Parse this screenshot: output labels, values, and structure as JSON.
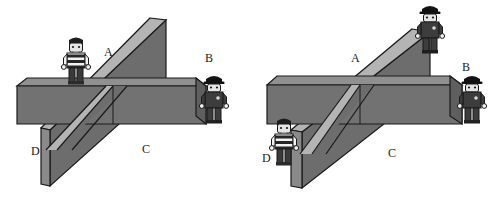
{
  "image": {
    "width": 499,
    "height": 201,
    "background": "#ffffff",
    "description": "Two side-by-side line drawings of a horizontal rectangular beam crossed by an inclined plank (ramp), with two toy minifigures placed at lettered positions."
  },
  "colors": {
    "beam_top_face": "#8f8f8f",
    "beam_front_face": "#707070",
    "ramp_face": "#6d6d6d",
    "ramp_edge": "#a9a9a9",
    "outline": "#1a1a1a",
    "label_text": "#1a1a1a",
    "prisoner_shirt_stripe_dark": "#2b2b2b",
    "prisoner_shirt_stripe_light": "#f2f2f2",
    "prisoner_skin": "#e8e8e8",
    "prisoner_hair": "#1e1e1e",
    "prisoner_legs": "#3a3a3a",
    "officer_uniform": "#3d3d3d",
    "officer_cap": "#141414",
    "officer_face": "#e8e8e8"
  },
  "panels": [
    {
      "id": "left-panel",
      "name": "left-diagram",
      "labels": [
        {
          "id": "left-label-a",
          "text": "A",
          "x": 104,
          "y": 46
        },
        {
          "id": "left-label-b",
          "text": "B",
          "x": 205,
          "y": 52
        },
        {
          "id": "left-label-c",
          "text": "C",
          "x": 142,
          "y": 143
        },
        {
          "id": "left-label-d",
          "text": "D",
          "x": 31,
          "y": 145
        }
      ],
      "figures": [
        {
          "id": "left-prisoner",
          "type": "prisoner",
          "name": "striped-shirt-figure",
          "standing_on": "beam top, left of crossing",
          "x": 60,
          "y": 36,
          "scale": 1.0
        },
        {
          "id": "left-officer",
          "type": "officer",
          "name": "police-officer-figure",
          "standing_on": "ground, right of beam",
          "x": 198,
          "y": 74,
          "scale": 1.0
        }
      ],
      "ramp": {
        "orientation": "steep",
        "direction": "lower-left to upper-right",
        "top_end_x": 164,
        "top_end_y": 18,
        "bottom_end_x": 50,
        "bottom_end_y": 186
      }
    },
    {
      "id": "right-panel",
      "name": "right-diagram",
      "labels": [
        {
          "id": "right-label-a",
          "text": "A",
          "x": 351,
          "y": 52
        },
        {
          "id": "right-label-b",
          "text": "B",
          "x": 462,
          "y": 61
        },
        {
          "id": "right-label-c",
          "text": "C",
          "x": 388,
          "y": 147
        },
        {
          "id": "right-label-d",
          "text": "D",
          "x": 262,
          "y": 152
        }
      ],
      "figures": [
        {
          "id": "right-officer-top",
          "type": "officer",
          "name": "police-officer-figure",
          "standing_on": "top of the inclined ramp",
          "x": 414,
          "y": 4,
          "scale": 1.0
        },
        {
          "id": "right-officer-side",
          "type": "officer",
          "name": "police-officer-figure",
          "standing_on": "ground, right of beam",
          "x": 456,
          "y": 74,
          "scale": 1.0
        },
        {
          "id": "right-prisoner",
          "type": "prisoner",
          "name": "striped-shirt-figure",
          "standing_on": "ground, left of beam",
          "x": 268,
          "y": 117,
          "scale": 1.0
        }
      ],
      "ramp": {
        "orientation": "shallow",
        "direction": "lower-left to upper-right",
        "top_end_x": 420,
        "top_end_y": 30,
        "bottom_end_x": 300,
        "bottom_end_y": 186
      }
    }
  ]
}
